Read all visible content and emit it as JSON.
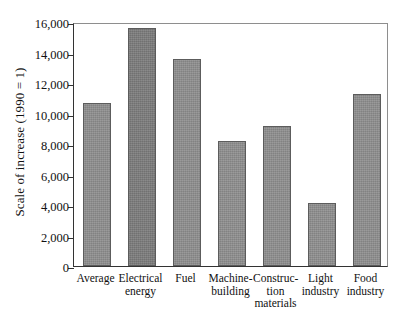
{
  "chart_data": {
    "type": "bar",
    "title": "",
    "xlabel": "",
    "ylabel": "Scale of increase (1990 = 1)",
    "categories": [
      "Average",
      "Electrical\nenergy",
      "Fuel",
      "Machine-\nbuilding",
      "Construc-\ntion\nmaterials",
      "Light\nindustry",
      "Food\nindustry"
    ],
    "values": [
      10700,
      15600,
      13600,
      8200,
      9150,
      4150,
      11300
    ],
    "ylim": [
      0,
      16000
    ],
    "ytick_values": [
      0,
      2000,
      4000,
      6000,
      8000,
      10000,
      12000,
      14000,
      16000
    ],
    "ytick_labels": [
      "0",
      "2,000",
      "4,000",
      "6,000",
      "8,000",
      "10,000",
      "12,000",
      "14,000",
      "16,000"
    ],
    "grid": false,
    "legend": null,
    "bar_color": "#8f8f8f",
    "bar_edge_color": "#5c5c5c",
    "axis_color": "#333333",
    "background_color": "#ffffff"
  }
}
